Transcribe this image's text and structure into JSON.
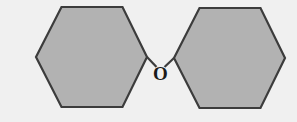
{
  "figure": {
    "kind": "chemical-structure-diagram",
    "background_color": "#f0f0f0",
    "canvas": {
      "width": 297,
      "height": 122
    }
  },
  "style": {
    "ring_fill": "#b2b2b2",
    "ring_stroke": "#3c3c3c",
    "ring_stroke_width": 2.2,
    "bond_stroke": "#3c3c3c",
    "bond_stroke_width": 2.2,
    "label_color": "#1a1a1a",
    "label_halo_color": "#f0f0f0"
  },
  "rings": [
    {
      "name": "left-benzene-ring",
      "label": "Phenyl ring (left)",
      "points": "36,57 61.5,7 122.5,7 147,57 122.5,107 61.5,107"
    },
    {
      "name": "right-benzene-ring",
      "label": "Phenyl ring (right)",
      "points": "174,58 199.5,8 260.5,8 285,58 260.5,108 199.5,108"
    }
  ],
  "bonds": [
    {
      "name": "bond-left-ring-to-oxygen",
      "x1": 147,
      "y1": 57,
      "x2": 157.0,
      "y2": 67.5
    },
    {
      "name": "bond-oxygen-to-right-ring",
      "x1": 164.0,
      "y1": 67.5,
      "x2": 174,
      "y2": 58
    }
  ],
  "atoms": [
    {
      "name": "oxygen-atom-label",
      "symbol": "O",
      "x": 160.5,
      "y": 75.5,
      "halo_rx": 7.5,
      "halo_ry": 8.5
    }
  ]
}
